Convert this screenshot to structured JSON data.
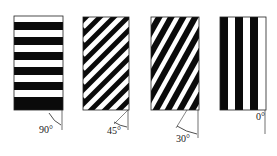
{
  "figure": {
    "panels": [
      {
        "id": "p90",
        "angle_label": "90°",
        "stripe_orientation": "horizontal"
      },
      {
        "id": "p45",
        "angle_label": "45°",
        "stripe_orientation": "diagonal-45"
      },
      {
        "id": "p30",
        "angle_label": "30°",
        "stripe_orientation": "diagonal-steep"
      },
      {
        "id": "p0",
        "angle_label": "0°",
        "stripe_orientation": "vertical"
      }
    ],
    "colors": {
      "stripe": "#0a0a0a",
      "background": "#ffffff",
      "line": "#333333"
    }
  }
}
